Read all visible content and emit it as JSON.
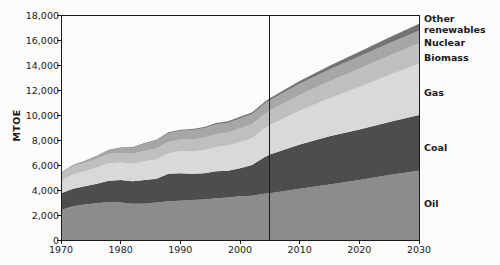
{
  "chart_data": {
    "type": "area",
    "stacked": true,
    "title": "",
    "xlabel": "",
    "ylabel": "MTOE",
    "xlim": [
      1970,
      2030
    ],
    "ylim": [
      0,
      18000
    ],
    "grid": false,
    "legend_position": "right-inline",
    "ytick_labels": [
      "0",
      "2,000",
      "4,000",
      "6,000",
      "8,000",
      "10,000",
      "12,000",
      "14,000",
      "16,000",
      "18,000"
    ],
    "ytick_values": [
      0,
      2000,
      4000,
      6000,
      8000,
      10000,
      12000,
      14000,
      16000,
      18000
    ],
    "xtick_labels": [
      "1970",
      "1980",
      "1990",
      "2000",
      "2010",
      "2020",
      "2030"
    ],
    "xtick_values": [
      1970,
      1980,
      1990,
      2000,
      2010,
      2020,
      2030
    ],
    "x": [
      1970,
      1972,
      1974,
      1976,
      1978,
      1980,
      1982,
      1984,
      1986,
      1988,
      1990,
      1992,
      1994,
      1996,
      1998,
      2000,
      2002,
      2004,
      2005,
      2010,
      2015,
      2020,
      2025,
      2030
    ],
    "annotations": [
      {
        "name": "projection-divider",
        "x": 2005,
        "label": ""
      }
    ],
    "series": [
      {
        "name": "Oil",
        "color": "#8c8c8c",
        "values": [
          2400,
          2700,
          2850,
          2950,
          3050,
          3000,
          2900,
          2900,
          3000,
          3100,
          3150,
          3200,
          3250,
          3350,
          3400,
          3500,
          3550,
          3700,
          3750,
          4100,
          4450,
          4800,
          5200,
          5550
        ]
      },
      {
        "name": "Coal",
        "color": "#4d4d4d",
        "values": [
          1350,
          1400,
          1450,
          1550,
          1700,
          1800,
          1800,
          1900,
          1900,
          2200,
          2200,
          2100,
          2100,
          2150,
          2150,
          2250,
          2450,
          2900,
          3100,
          3550,
          3850,
          4050,
          4250,
          4450
        ]
      },
      {
        "name": "Gas",
        "color": "#d9d9d9",
        "values": [
          1000,
          1150,
          1200,
          1300,
          1400,
          1400,
          1400,
          1500,
          1550,
          1650,
          1750,
          1800,
          1850,
          1950,
          2000,
          2100,
          2150,
          2300,
          2350,
          2700,
          3050,
          3400,
          3750,
          4100
        ]
      },
      {
        "name": "Biomass",
        "color": "#bfbfbf",
        "values": [
          600,
          640,
          670,
          700,
          740,
          770,
          800,
          830,
          870,
          900,
          930,
          960,
          990,
          1020,
          1050,
          1080,
          1110,
          1140,
          1150,
          1250,
          1350,
          1450,
          1550,
          1650
        ]
      },
      {
        "name": "Nuclear",
        "color": "#a6a6a6",
        "values": [
          30,
          80,
          140,
          210,
          290,
          380,
          470,
          570,
          650,
          700,
          720,
          740,
          760,
          780,
          790,
          800,
          810,
          820,
          830,
          900,
          950,
          980,
          1000,
          1000
        ]
      },
      {
        "name": "Other renewables",
        "color": "#737373",
        "values": [
          20,
          25,
          30,
          35,
          40,
          45,
          50,
          55,
          60,
          70,
          80,
          90,
          100,
          110,
          120,
          130,
          140,
          150,
          160,
          220,
          300,
          380,
          460,
          550
        ]
      }
    ],
    "legend_labels": [
      {
        "name": "Other renewables",
        "text": "Other\nrenewables",
        "top": 14
      },
      {
        "name": "Nuclear",
        "text": "Nuclear",
        "top": 38
      },
      {
        "name": "Biomass",
        "text": "Biomass",
        "top": 53
      },
      {
        "name": "Gas",
        "text": "Gas",
        "top": 88
      },
      {
        "name": "Coal",
        "text": "Coal",
        "top": 143
      },
      {
        "name": "Oil",
        "text": "Oil",
        "top": 199
      }
    ]
  }
}
